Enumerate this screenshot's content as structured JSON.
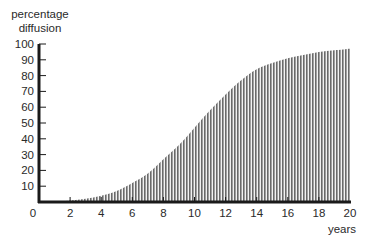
{
  "chart_data": {
    "type": "area",
    "title": "",
    "xlabel": "years",
    "ylabel": "percentage diffusion",
    "ylabel_lines": [
      "percentage",
      "diffusion"
    ],
    "xlim": [
      0,
      20
    ],
    "ylim": [
      0,
      100
    ],
    "x_ticks": [
      0,
      2,
      4,
      6,
      8,
      10,
      12,
      14,
      16,
      18,
      20
    ],
    "y_ticks": [
      10,
      20,
      30,
      40,
      50,
      60,
      70,
      80,
      90,
      100
    ],
    "grid": false,
    "legend": null,
    "fill": "vertical hatching",
    "series": [
      {
        "name": "diffusion",
        "x": [
          1,
          2,
          3,
          4,
          5,
          6,
          7,
          8,
          9,
          10,
          11,
          12,
          13,
          14,
          15,
          16,
          17,
          18,
          19,
          20
        ],
        "values": [
          0,
          1,
          2,
          4,
          7,
          12,
          18,
          27,
          36,
          47,
          58,
          68,
          77,
          84,
          88,
          91,
          93,
          95,
          96,
          97
        ]
      }
    ]
  }
}
